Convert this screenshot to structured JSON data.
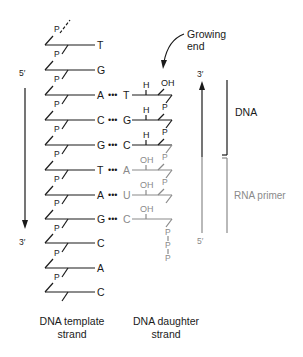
{
  "diagram": {
    "title_labels": {
      "growing_end_line1": "Growing",
      "growing_end_line2": "end",
      "template_caption_line1": "DNA template",
      "template_caption_line2": "strand",
      "daughter_caption_line1": "DNA daughter",
      "daughter_caption_line2": "strand",
      "dna_bracket": "DNA",
      "rna_bracket": "RNA primer"
    },
    "left_arrow": {
      "top_label": "5′",
      "bottom_label": "3′"
    },
    "right_arrow": {
      "top_label": "3′",
      "bottom_label": "5′"
    },
    "phosphate_label": "P",
    "template_bases": [
      "T",
      "G",
      "A",
      "C",
      "G",
      "T",
      "A",
      "G",
      "C",
      "A",
      "C"
    ],
    "daughter_bases": [
      "",
      "",
      "T",
      "G",
      "C",
      "A",
      "U",
      "C",
      "",
      "",
      ""
    ],
    "daughter_sugar_groups": [
      "",
      "",
      "H",
      "H",
      "H",
      "OH",
      "OH",
      "OH",
      "",
      "",
      ""
    ],
    "daughter_top_group": "OH",
    "triphosphate": [
      "P",
      "P",
      "P"
    ],
    "pair_dots": "•••",
    "colors": {
      "dna": "#1a1a1a",
      "rna": "#8a8a8a"
    }
  }
}
